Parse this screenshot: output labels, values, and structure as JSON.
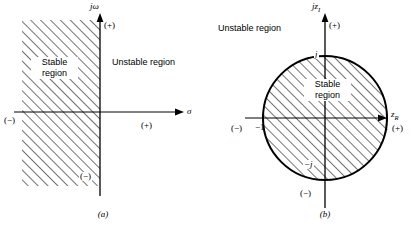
{
  "figure": {
    "panels": [
      {
        "id": "a",
        "caption": "(a)",
        "plane": "s-plane",
        "vertical_axis_label": "jω",
        "horizontal_axis_label": "σ",
        "signs": {
          "vertical_positive": "(+)",
          "vertical_negative": "(−)",
          "horizontal_positive": "(+)",
          "horizontal_negative": "(−)"
        },
        "stable_region_label_line1": "Stable",
        "stable_region_label_line2": "region",
        "unstable_region_label_line1": "Unstable",
        "unstable_region_label_line2": "region",
        "shaded_description": "left half plane hatched"
      },
      {
        "id": "b",
        "caption": "(b)",
        "plane": "z-plane",
        "vertical_axis_label_main": "jz",
        "vertical_axis_label_sub": "I",
        "horizontal_axis_label_main": "z",
        "horizontal_axis_label_sub": "R",
        "signs": {
          "vertical_positive": "(+)",
          "vertical_negative": "(−)",
          "horizontal_positive": "(+)",
          "horizontal_negative": "(−)"
        },
        "tick_labels": {
          "left": "−1",
          "right": "1",
          "top": "j",
          "bottom": "−j"
        },
        "stable_region_label_line1": "Stable",
        "stable_region_label_line2": "region",
        "unstable_region_label_line1": "Unstable",
        "unstable_region_label_line2": "region",
        "shaded_description": "unit circle interior hatched"
      }
    ],
    "colors": {
      "ink": "#000000",
      "background": "#ffffff"
    }
  }
}
